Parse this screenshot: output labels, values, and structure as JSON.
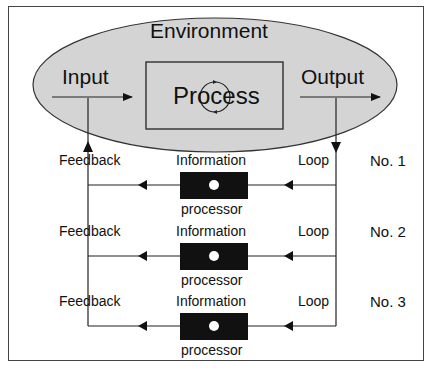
{
  "diagram": {
    "environment": {
      "label": "Environment",
      "fill": "#d4d4d4"
    },
    "input": {
      "label": "Input"
    },
    "process": {
      "label": "Process"
    },
    "output": {
      "label": "Output"
    },
    "loops": [
      {
        "left_label": "Feedback",
        "top_label": "Information",
        "bottom_label": "processor",
        "right_label": "Loop",
        "number": "No. 1"
      },
      {
        "left_label": "Feedback",
        "top_label": "Information",
        "bottom_label": "processor",
        "right_label": "Loop",
        "number": "No. 2"
      },
      {
        "left_label": "Feedback",
        "top_label": "Information",
        "bottom_label": "processor",
        "right_label": "Loop",
        "number": "No. 3"
      }
    ],
    "colors": {
      "line": "#222222",
      "processor_box": "#111111",
      "processor_dot": "#ffffff"
    }
  }
}
